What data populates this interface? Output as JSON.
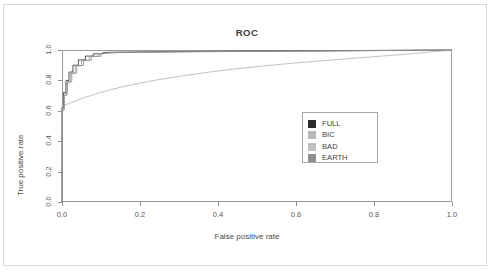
{
  "chart_data": {
    "type": "line",
    "title": "ROC",
    "xlabel": "False positive rate",
    "ylabel": "True positive rate",
    "xlim": [
      0,
      1
    ],
    "ylim": [
      0,
      1
    ],
    "grid": false,
    "legend_position": "center-right",
    "xticks": [
      "0.0",
      "0.2",
      "0.4",
      "0.6",
      "0.8",
      "1.0"
    ],
    "xtick_values": [
      0,
      0.2,
      0.4,
      0.6,
      0.8,
      1.0
    ],
    "yticks": [
      "0.0",
      "0.2",
      "0.4",
      "0.6",
      "0.8",
      "1.0"
    ],
    "ytick_values": [
      0,
      0.2,
      0.4,
      0.6,
      0.8,
      1.0
    ],
    "series": [
      {
        "name": "FULL",
        "color": "#2b2b2b",
        "x": [
          0,
          0,
          0.004,
          0.004,
          0.01,
          0.01,
          0.018,
          0.018,
          0.028,
          0.028,
          0.042,
          0.042,
          0.06,
          0.06,
          0.08,
          0.08,
          0.105,
          0.105,
          0.14,
          0.3,
          0.6,
          1.0
        ],
        "y": [
          0,
          0.62,
          0.62,
          0.72,
          0.72,
          0.8,
          0.8,
          0.855,
          0.855,
          0.9,
          0.9,
          0.935,
          0.935,
          0.96,
          0.96,
          0.975,
          0.975,
          0.984,
          0.986,
          0.99,
          0.994,
          1.0
        ]
      },
      {
        "name": "BIC",
        "color": "#9d9d9d",
        "x": [
          0,
          0,
          0.005,
          0.005,
          0.012,
          0.012,
          0.022,
          0.022,
          0.034,
          0.034,
          0.05,
          0.05,
          0.07,
          0.07,
          0.095,
          0.095,
          0.13,
          0.32,
          0.65,
          1.0
        ],
        "y": [
          0,
          0.6,
          0.6,
          0.7,
          0.7,
          0.785,
          0.785,
          0.845,
          0.845,
          0.895,
          0.895,
          0.93,
          0.93,
          0.958,
          0.958,
          0.975,
          0.982,
          0.988,
          0.993,
          1.0
        ]
      },
      {
        "name": "BAD",
        "color": "#b4b4b4",
        "x": [
          0,
          0,
          0.02,
          0.05,
          0.1,
          0.15,
          0.2,
          0.25,
          0.3,
          0.35,
          0.4,
          0.45,
          0.5,
          0.55,
          0.6,
          0.65,
          0.7,
          0.75,
          0.8,
          0.85,
          0.9,
          0.95,
          1.0
        ],
        "y": [
          0,
          0.63,
          0.65,
          0.68,
          0.722,
          0.755,
          0.782,
          0.806,
          0.826,
          0.845,
          0.862,
          0.877,
          0.891,
          0.903,
          0.915,
          0.926,
          0.936,
          0.946,
          0.956,
          0.966,
          0.976,
          0.988,
          1.0
        ]
      },
      {
        "name": "EARTH",
        "color": "#8a8a8a",
        "x": [
          0,
          0,
          0.006,
          0.006,
          0.014,
          0.014,
          0.025,
          0.025,
          0.038,
          0.038,
          0.055,
          0.055,
          0.075,
          0.075,
          0.1,
          0.1,
          0.135,
          0.34,
          0.68,
          1.0
        ],
        "y": [
          0,
          0.61,
          0.61,
          0.71,
          0.71,
          0.793,
          0.793,
          0.85,
          0.85,
          0.898,
          0.898,
          0.933,
          0.933,
          0.959,
          0.959,
          0.976,
          0.983,
          0.989,
          0.994,
          1.0
        ]
      }
    ],
    "legend": [
      {
        "label": "FULL",
        "color": "#2b2b2b"
      },
      {
        "label": "BIC",
        "color": "#b9b9b9"
      },
      {
        "label": "BAD",
        "color": "#c2c2c2"
      },
      {
        "label": "EARTH",
        "color": "#8f8f8f"
      }
    ]
  }
}
